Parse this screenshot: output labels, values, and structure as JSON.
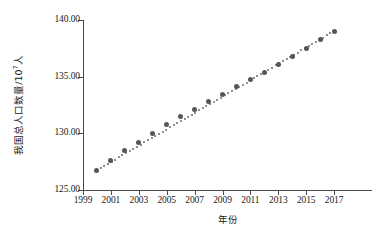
{
  "chart_data": {
    "type": "scatter",
    "title": "",
    "subtitle": "",
    "xlabel": "年份",
    "ylabel": "我国总人口数量/10⁷人",
    "ylabel_base": "我国总人口数量/10",
    "ylabel_exponent": "7",
    "ylabel_suffix": "人",
    "xlim": [
      1999,
      2018
    ],
    "ylim": [
      125.0,
      140.0
    ],
    "grid": false,
    "legend": null,
    "marker_color": "#565656",
    "trendline_color": "#6a6a6a",
    "axis_color": "#4a4a4a",
    "x_tick_labels": [
      "1999",
      "2001",
      "2003",
      "2005",
      "2007",
      "2009",
      "2011",
      "2013",
      "2015",
      "2017"
    ],
    "x_tick_values": [
      1999,
      2001,
      2003,
      2005,
      2007,
      2009,
      2011,
      2013,
      2015,
      2017
    ],
    "y_tick_labels": [
      "125.00",
      "130.00",
      "135.00",
      "140.00"
    ],
    "y_tick_values": [
      125.0,
      130.0,
      135.0,
      140.0
    ],
    "x": [
      2000,
      2001,
      2002,
      2003,
      2004,
      2005,
      2006,
      2007,
      2008,
      2009,
      2010,
      2011,
      2012,
      2013,
      2014,
      2015,
      2016,
      2017
    ],
    "values": [
      126.74,
      127.63,
      128.45,
      129.23,
      129.99,
      130.76,
      131.45,
      132.13,
      132.8,
      133.45,
      134.09,
      134.74,
      135.4,
      136.07,
      136.78,
      137.46,
      138.27,
      139.01
    ],
    "series": [
      {
        "name": "我国总人口数量",
        "values": [
          126.74,
          127.63,
          128.45,
          129.23,
          129.99,
          130.76,
          131.45,
          132.13,
          132.8,
          133.45,
          134.09,
          134.74,
          135.4,
          136.07,
          136.78,
          137.46,
          138.27,
          139.01
        ]
      }
    ],
    "trendline": {
      "type": "linear",
      "style": "dotted",
      "x_start": 2000,
      "x_end": 2017,
      "y_start": 126.74,
      "y_end": 139.01
    }
  }
}
